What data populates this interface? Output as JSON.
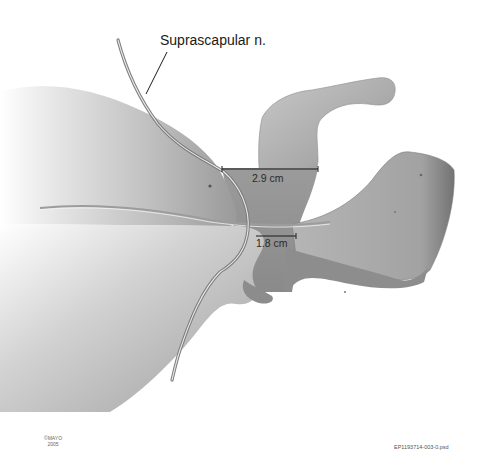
{
  "figure": {
    "title_label": "Suprascapular n.",
    "measurements": [
      {
        "label": "2.9 cm"
      },
      {
        "label": "1.8 cm"
      }
    ],
    "copyright": {
      "line1": "©MAYO",
      "line2": "2005"
    },
    "file_id": "EP1193714-003-0.psd"
  },
  "colors": {
    "background": "#ffffff",
    "bone_light": "#c9c9c9",
    "bone_mid": "#a8a8a8",
    "bone_dark": "#6e6e6e",
    "nerve": "#8a8a8a",
    "line": "#1a1a1a"
  }
}
